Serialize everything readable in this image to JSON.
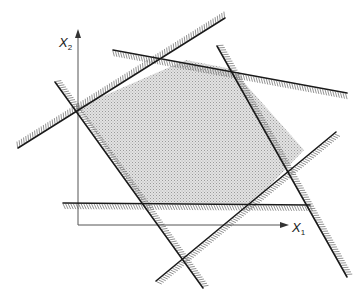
{
  "diagram": {
    "type": "feasible-region",
    "axes": {
      "x_label": "X",
      "x_sub": "1",
      "y_label": "X",
      "y_sub": "2",
      "origin": [
        78,
        225
      ],
      "x_end": [
        287,
        225
      ],
      "y_end": [
        78,
        30
      ]
    },
    "constraint_lines": [
      {
        "id": "c1",
        "from": [
          18,
          148
        ],
        "to": [
          225,
          18
        ]
      },
      {
        "id": "c2",
        "from": [
          113,
          50
        ],
        "to": [
          347,
          93
        ]
      },
      {
        "id": "c3",
        "from": [
          217,
          46
        ],
        "to": [
          347,
          277
        ]
      },
      {
        "id": "c4",
        "from": [
          156,
          281
        ],
        "to": [
          336,
          132
        ]
      },
      {
        "id": "c5",
        "from": [
          63,
          203
        ],
        "to": [
          310,
          205
        ]
      },
      {
        "id": "c6",
        "from": [
          55,
          82
        ],
        "to": [
          203,
          288
        ]
      }
    ],
    "feasible_polygon": [
      [
        78,
        107
      ],
      [
        186,
        60
      ],
      [
        232,
        69
      ],
      [
        304,
        150
      ],
      [
        252,
        204
      ],
      [
        143,
        203
      ]
    ],
    "colors": {
      "line": "#1a1a1a",
      "fill": "#d4d4d4",
      "hatch": "#6b6b6b"
    }
  }
}
